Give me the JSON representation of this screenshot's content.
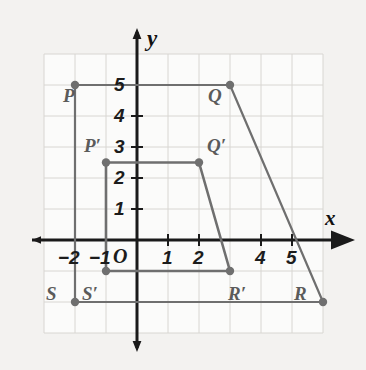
{
  "figure": {
    "type": "coordinate-plane-transformation",
    "background_color": "#f3f2f0",
    "grid_color": "#d8d6d2",
    "axis_color": "#1a1a1a",
    "shape_color": "#6f6f6f",
    "vertex_color": "#6f6f6f",
    "label_color": "#5b5b5b"
  },
  "axes": {
    "x_axis_name": "x",
    "y_axis_name": "y",
    "origin_label": "O",
    "x_range": [
      -3,
      6
    ],
    "y_range": [
      -3,
      6
    ],
    "unit_px": 31,
    "origin_px": {
      "x": 137,
      "y": 240
    },
    "x_tick_labels": [
      {
        "value": -2,
        "text": "−2"
      },
      {
        "value": -1,
        "text": "−1"
      },
      {
        "value": 1,
        "text": "1"
      },
      {
        "value": 2,
        "text": "2"
      },
      {
        "value": 4,
        "text": "4"
      },
      {
        "value": 5,
        "text": "5"
      }
    ],
    "y_tick_labels": [
      {
        "value": 1,
        "text": "1"
      },
      {
        "value": 2,
        "text": "2"
      },
      {
        "value": 3,
        "text": "3"
      },
      {
        "value": 4,
        "text": "4"
      },
      {
        "value": 5,
        "text": "5"
      }
    ]
  },
  "chart_data": {
    "type": "scatter",
    "title": "",
    "xlabel": "x",
    "ylabel": "y",
    "xlim": [
      -3,
      6
    ],
    "ylim": [
      -3,
      6
    ],
    "grid": true,
    "legend": "none",
    "shapes": [
      {
        "name": "PQRS",
        "kind": "trapezoid",
        "closed": true,
        "vertices": [
          {
            "label": "P",
            "x": -2,
            "y": 5
          },
          {
            "label": "Q",
            "x": 3,
            "y": 5
          },
          {
            "label": "R",
            "x": 6,
            "y": -2
          },
          {
            "label": "S",
            "x": -2,
            "y": -2
          }
        ]
      },
      {
        "name": "P'Q'R'S'",
        "kind": "trapezoid",
        "closed": true,
        "vertices": [
          {
            "label": "P′",
            "x": -1,
            "y": 2.5
          },
          {
            "label": "Q′",
            "x": 2,
            "y": 2.5
          },
          {
            "label": "R′",
            "x": 3,
            "y": -1
          },
          {
            "label": "S′",
            "x": -1,
            "y": -1
          }
        ]
      }
    ]
  },
  "vertex_labels": [
    {
      "name": "P",
      "text": "P",
      "px": 63,
      "py": 86
    },
    {
      "name": "Q",
      "text": "Q",
      "px": 208,
      "py": 86
    },
    {
      "name": "Pp",
      "text": "P′",
      "px": 84,
      "py": 136
    },
    {
      "name": "Qp",
      "text": "Q′",
      "px": 207,
      "py": 136
    },
    {
      "name": "S",
      "text": "S",
      "px": 46,
      "py": 284
    },
    {
      "name": "Sp",
      "text": "S′",
      "px": 82,
      "py": 284
    },
    {
      "name": "Rp",
      "text": "R′",
      "px": 228,
      "py": 284
    },
    {
      "name": "R",
      "text": "R",
      "px": 294,
      "py": 284
    }
  ]
}
